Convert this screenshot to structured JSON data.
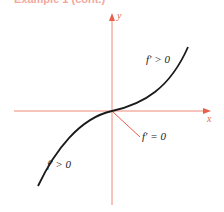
{
  "figure": {
    "heading_fragment": "Example 1 (cont.)",
    "axes": {
      "x_label": "x",
      "y_label": "y",
      "color": "#e8604a"
    },
    "curve": {
      "description": "cubic-like increasing curve with horizontal tangent at origin",
      "color": "#1a1a1a"
    },
    "annotations": {
      "upper_right": "f′ > 0",
      "lower_left": "f′ > 0",
      "origin": "f′ = 0"
    }
  }
}
